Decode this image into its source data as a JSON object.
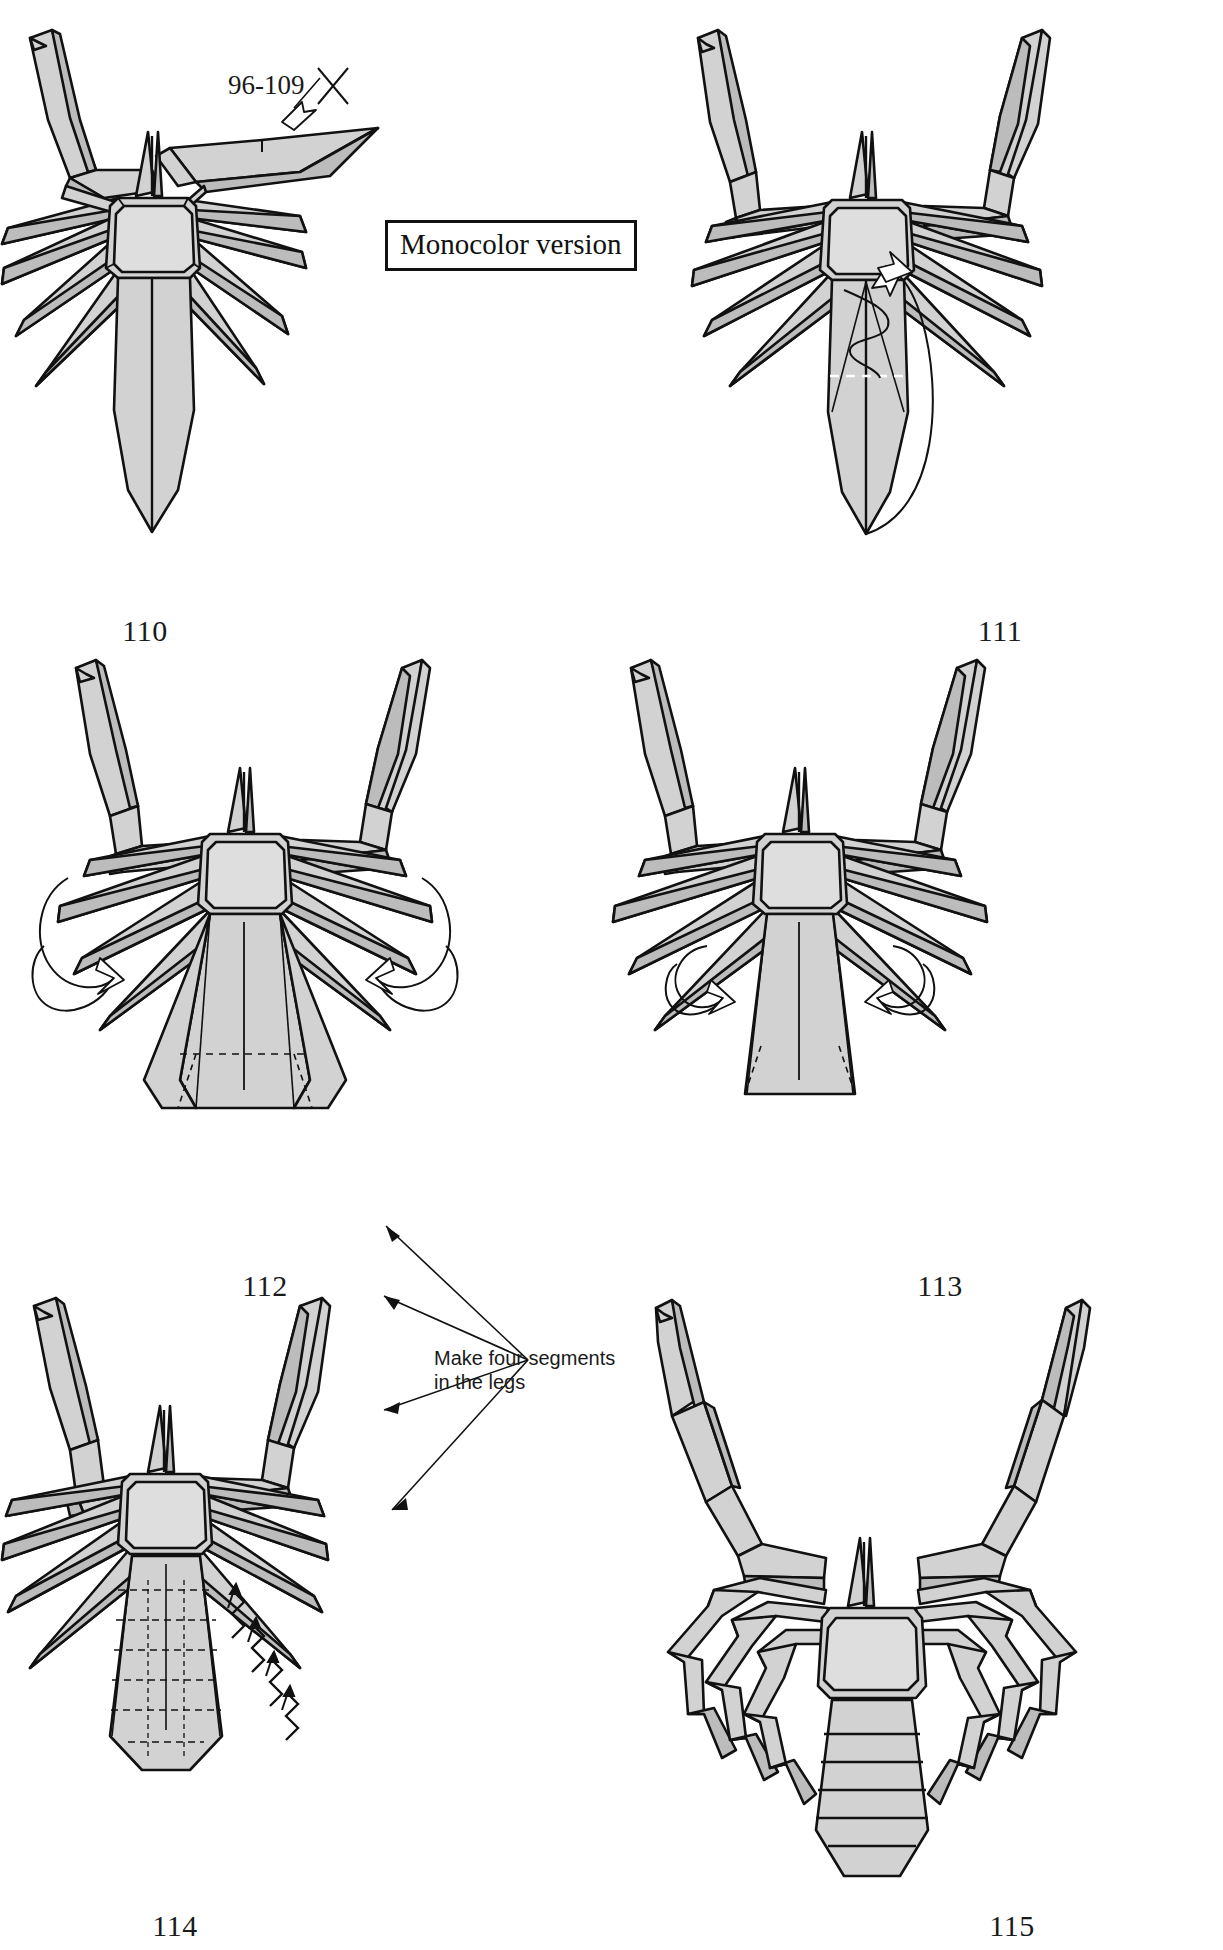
{
  "page": {
    "width": 1223,
    "height": 1950,
    "background": "#ffffff",
    "paper_fill": "#d2d2d2",
    "paper_fill_dark": "#bcbcbc",
    "paper_fill_light": "#dedede",
    "line_color": "#111111"
  },
  "callout": {
    "monocolor_label": "Monocolor version"
  },
  "annotations": {
    "repeat_steps": "96-109",
    "legs_note_line1": "Make four segments",
    "legs_note_line2": "in the legs"
  },
  "steps": [
    {
      "id": "110",
      "number": "110",
      "label_x": 145,
      "label_y": 614
    },
    {
      "id": "111",
      "number": "111",
      "label_x": 1000,
      "label_y": 614
    },
    {
      "id": "112",
      "number": "112",
      "label_x": 265,
      "label_y": 1269
    },
    {
      "id": "113",
      "number": "113",
      "label_x": 940,
      "label_y": 1269
    },
    {
      "id": "114",
      "number": "114",
      "label_x": 175,
      "label_y": 1909
    },
    {
      "id": "115",
      "number": "115",
      "label_x": 1012,
      "label_y": 1909
    }
  ]
}
